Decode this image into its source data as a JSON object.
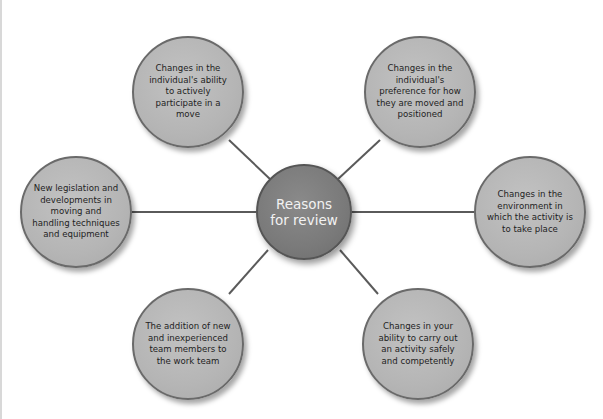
{
  "diagram": {
    "type": "hub-and-spoke",
    "colors": {
      "outer_fill": "#b8b8b8",
      "outer_border": "#6a6a6a",
      "center_fill": "#7b7b7b",
      "center_border": "#555555",
      "connector": "#5a5a5a",
      "center_text": "#f2f2f2",
      "outer_text": "#1e1e1e"
    },
    "center": {
      "label": "Reasons for review"
    },
    "nodes": [
      {
        "position": "top-left",
        "label": "Changes in the individual's ability to actively participate in a move"
      },
      {
        "position": "top-right",
        "label": "Changes in the individual's preference for how they are moved and positioned"
      },
      {
        "position": "left",
        "label": "New legislation and developments in moving and handling techniques and equipment"
      },
      {
        "position": "right",
        "label": "Changes in the environment in which the activity is to take place"
      },
      {
        "position": "bottom-left",
        "label": "The addition of new and inexperienced team members to the work team"
      },
      {
        "position": "bottom-right",
        "label": "Changes in your ability to carry out an activity safely and competently"
      }
    ]
  }
}
